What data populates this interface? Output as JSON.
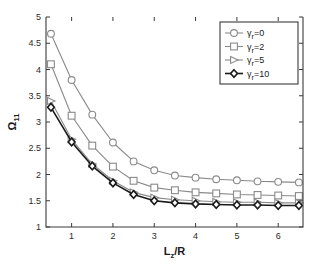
{
  "chart_data": {
    "type": "line",
    "title": "",
    "xlabel": "L_z/R",
    "xlabel_parts": {
      "main": "L",
      "sub": "z",
      "tail": "/R"
    },
    "ylabel": "Ω_11",
    "ylabel_parts": {
      "main": "Ω",
      "sub": "11"
    },
    "xlim": [
      0.38,
      6.6
    ],
    "ylim": [
      1,
      5
    ],
    "xticks": [
      1,
      2,
      3,
      4,
      5,
      6
    ],
    "yticks": [
      1,
      1.5,
      2,
      2.5,
      3,
      3.5,
      4,
      4.5,
      5
    ],
    "xticklabels": [
      "1",
      "2",
      "3",
      "4",
      "5",
      "6"
    ],
    "yticklabels": [
      "1",
      "1.5",
      "2",
      "2.5",
      "3",
      "3.5",
      "4",
      "4.5",
      "5"
    ],
    "grid": false,
    "legend_position": "upper-right",
    "x": [
      0.5,
      1.0,
      1.5,
      2.0,
      2.5,
      3.0,
      3.5,
      4.0,
      4.5,
      5.0,
      5.5,
      6.0,
      6.5
    ],
    "series": [
      {
        "name": "γr=0",
        "label_main": "γ",
        "label_sub": "r",
        "label_tail": "=0",
        "marker": "circle",
        "color": "#8a8a8a",
        "linewidth": 1.1,
        "values": [
          4.68,
          3.8,
          3.14,
          2.61,
          2.25,
          2.08,
          1.98,
          1.94,
          1.91,
          1.89,
          1.87,
          1.86,
          1.85
        ]
      },
      {
        "name": "γr=2",
        "label_main": "γ",
        "label_sub": "r",
        "label_tail": "=2",
        "marker": "square",
        "color": "#8a8a8a",
        "linewidth": 1.1,
        "values": [
          4.1,
          3.12,
          2.55,
          2.15,
          1.88,
          1.75,
          1.7,
          1.66,
          1.64,
          1.62,
          1.61,
          1.6,
          1.59
        ]
      },
      {
        "name": "γr=5",
        "label_main": "γ",
        "label_sub": "r",
        "label_tail": "=5",
        "marker": "triangle-right",
        "color": "#8a8a8a",
        "linewidth": 1.1,
        "values": [
          3.4,
          2.67,
          2.2,
          1.88,
          1.66,
          1.56,
          1.52,
          1.5,
          1.48,
          1.47,
          1.47,
          1.46,
          1.46
        ]
      },
      {
        "name": "γr=10",
        "label_main": "γ",
        "label_sub": "r",
        "label_tail": "=10",
        "marker": "diamond",
        "color": "#1a1a1a",
        "linewidth": 1.6,
        "values": [
          3.28,
          2.62,
          2.16,
          1.84,
          1.62,
          1.5,
          1.46,
          1.44,
          1.43,
          1.42,
          1.42,
          1.41,
          1.41
        ]
      }
    ]
  }
}
